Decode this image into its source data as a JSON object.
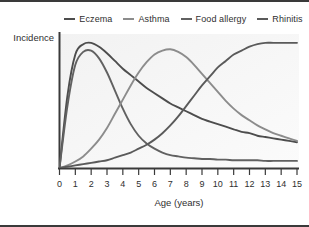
{
  "figure": {
    "background_color": "#ffffff",
    "rule_color": "#3a3a3a"
  },
  "legend": {
    "position": "top-center",
    "items": [
      {
        "label": "Eczema",
        "color": "#4d4d4d",
        "icon": "line-dash-icon"
      },
      {
        "label": "Asthma",
        "color": "#8c8c8c",
        "icon": "line-dash-icon"
      },
      {
        "label": "Food allergy",
        "color": "#616161",
        "icon": "line-dash-icon"
      },
      {
        "label": "Rhinitis",
        "color": "#5a5a5a",
        "icon": "line-dash-icon"
      }
    ]
  },
  "chart_data": {
    "type": "line",
    "title": "",
    "subtitle": "",
    "xlabel": "Age (years)",
    "ylabel": "Incidence",
    "xlim": [
      0,
      15
    ],
    "ylim": [
      0,
      100
    ],
    "grid": false,
    "legend_position": "top-center",
    "xticks": [
      "0",
      "1",
      "2",
      "3",
      "4",
      "5",
      "6",
      "7",
      "8",
      "9",
      "10",
      "11",
      "12",
      "13",
      "14",
      "15"
    ],
    "yticks": [],
    "x": [
      0,
      0.5,
      1,
      1.5,
      2,
      2.5,
      3,
      3.5,
      4,
      4.5,
      5,
      5.5,
      6,
      6.5,
      7,
      7.5,
      8,
      8.5,
      9,
      9.5,
      10,
      10.5,
      11,
      11.5,
      12,
      12.5,
      13,
      13.5,
      14,
      14.5,
      15
    ],
    "series": [
      {
        "name": "Eczema",
        "color": "#4d4d4d",
        "peak_age": 2,
        "values": [
          0,
          56,
          88,
          96,
          97,
          94,
          89,
          83,
          77,
          72,
          67,
          62,
          58,
          54,
          50,
          47,
          44,
          41,
          38,
          36,
          34,
          32,
          30,
          28,
          27,
          25,
          24,
          23,
          22,
          21,
          20
        ]
      },
      {
        "name": "Food allergy",
        "color": "#616161",
        "peak_age": 2,
        "values": [
          0,
          48,
          80,
          90,
          91,
          85,
          74,
          60,
          46,
          34,
          25,
          19,
          15,
          12,
          10,
          9,
          8,
          7.5,
          7,
          7,
          6.5,
          6.5,
          6,
          6,
          6,
          6,
          5.5,
          5.5,
          5.5,
          5.5,
          5.5
        ]
      },
      {
        "name": "Asthma",
        "color": "#8c8c8c",
        "peak_age": 7,
        "values": [
          0,
          2,
          5,
          9,
          15,
          22,
          31,
          42,
          53,
          64,
          74,
          82,
          88,
          91,
          92,
          90,
          86,
          80,
          73,
          66,
          59,
          52,
          46,
          41,
          37,
          33,
          30,
          27,
          25,
          23,
          21
        ]
      },
      {
        "name": "Rhinitis",
        "color": "#5a5a5a",
        "peak_age": 14,
        "values": [
          0,
          1,
          2,
          3,
          4,
          5,
          6,
          8,
          10,
          12,
          15,
          18,
          22,
          27,
          33,
          40,
          48,
          56,
          64,
          71,
          78,
          83,
          88,
          91,
          94,
          96,
          97,
          97,
          97,
          97,
          97
        ]
      }
    ]
  }
}
